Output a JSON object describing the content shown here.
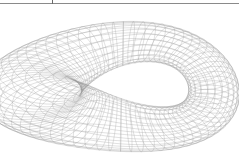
{
  "figure": {
    "mesh_color": "#9a9a9a",
    "background": "#ffffff",
    "border_color": "#8a8a8a"
  }
}
